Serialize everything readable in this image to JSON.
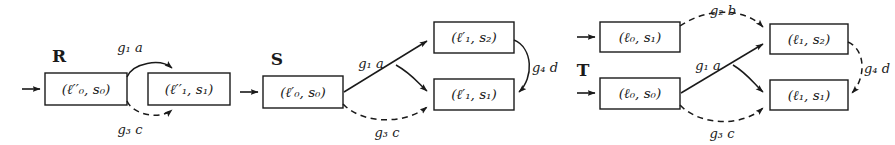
{
  "figure": {
    "width": 895,
    "height": 145,
    "background": "#ffffff",
    "ink_color": "#1a1a1a"
  },
  "automata": [
    {
      "name": "R",
      "name_label": "R",
      "states": [
        {
          "id": "r0",
          "label": "(ℓ′′₀, s₀)",
          "loc": "ℓ′′₀",
          "sig": "s₀",
          "initial": true
        },
        {
          "id": "r1",
          "label": "(ℓ′′₁, s₁)",
          "loc": "ℓ′′₁",
          "sig": "s₁",
          "initial": false
        }
      ],
      "transitions": [
        {
          "from": "r0",
          "to": "r1",
          "label": "g₁ a",
          "guard": "g₁",
          "event": "a",
          "style": "solid",
          "position": "upper-arc"
        },
        {
          "from": "r0",
          "to": "r1",
          "label": "g₃ c",
          "guard": "g₃",
          "event": "c",
          "style": "dashed",
          "position": "lower-arc"
        }
      ]
    },
    {
      "name": "S",
      "name_label": "S",
      "states": [
        {
          "id": "s0",
          "label": "(ℓ′₀, s₀)",
          "loc": "ℓ′₀",
          "sig": "s₀",
          "initial": true
        },
        {
          "id": "s2",
          "label": "(ℓ′₁, s₂)",
          "loc": "ℓ′₁",
          "sig": "s₂",
          "initial": false
        },
        {
          "id": "s1",
          "label": "(ℓ′₁, s₁)",
          "loc": "ℓ′₁",
          "sig": "s₁",
          "initial": false
        }
      ],
      "transitions": [
        {
          "from": "s0",
          "to": "s2",
          "label": "g₁ a",
          "guard": "g₁",
          "event": "a",
          "style": "solid",
          "position": "up-right"
        },
        {
          "from": "s0",
          "to": "s1",
          "label": "",
          "guard": "g₁",
          "event": "a",
          "style": "solid",
          "position": "branch-down"
        },
        {
          "from": "s2",
          "to": "s1",
          "label": "g₄ d",
          "guard": "g₄",
          "event": "d",
          "style": "solid",
          "position": "right-curve"
        },
        {
          "from": "s0",
          "to": "s1",
          "label": "g₃ c",
          "guard": "g₃",
          "event": "c",
          "style": "dashed",
          "position": "lower-arc"
        }
      ]
    },
    {
      "name": "T",
      "name_label": "T",
      "states": [
        {
          "id": "t01",
          "label": "(ℓ₀, s₁)",
          "loc": "ℓ₀",
          "sig": "s₁",
          "initial": true
        },
        {
          "id": "t00",
          "label": "(ℓ₀, s₀)",
          "loc": "ℓ₀",
          "sig": "s₀",
          "initial": true
        },
        {
          "id": "t12",
          "label": "(ℓ₁, s₂)",
          "loc": "ℓ₁",
          "sig": "s₂",
          "initial": false
        },
        {
          "id": "t11",
          "label": "(ℓ₁, s₁)",
          "loc": "ℓ₁",
          "sig": "s₁",
          "initial": false
        }
      ],
      "transitions": [
        {
          "from": "t01",
          "to": "t12",
          "label": "g₂ b",
          "guard": "g₂",
          "event": "b",
          "style": "dashed",
          "position": "upper-arc"
        },
        {
          "from": "t00",
          "to": "t12",
          "label": "g₁ a",
          "guard": "g₁",
          "event": "a",
          "style": "solid",
          "position": "up-right"
        },
        {
          "from": "t00",
          "to": "t11",
          "label": "",
          "guard": "g₁",
          "event": "a",
          "style": "solid",
          "position": "branch-down"
        },
        {
          "from": "t12",
          "to": "t11",
          "label": "g₄ d",
          "guard": "g₄",
          "event": "d",
          "style": "dashed",
          "position": "right-curve"
        },
        {
          "from": "t00",
          "to": "t11",
          "label": "g₃ c",
          "guard": "g₃",
          "event": "c",
          "style": "dashed",
          "position": "lower-arc"
        }
      ]
    }
  ],
  "labels": {
    "r_name": "R",
    "r_state0": "(ℓ′′₀, s₀)",
    "r_state1": "(ℓ′′₁, s₁)",
    "r_edge_top": "g₁ a",
    "r_edge_bottom": "g₃ c",
    "s_name": "S",
    "s_state0": "(ℓ′₀, s₀)",
    "s_state2": "(ℓ′₁, s₂)",
    "s_state1": "(ℓ′₁, s₁)",
    "s_edge_a": "g₁ a",
    "s_edge_d": "g₄ d",
    "s_edge_c": "g₃ c",
    "t_name": "T",
    "t_state01": "(ℓ₀, s₁)",
    "t_state00": "(ℓ₀, s₀)",
    "t_state12": "(ℓ₁, s₂)",
    "t_state11": "(ℓ₁, s₁)",
    "t_edge_b": "g₂ b",
    "t_edge_a": "g₁ a",
    "t_edge_d": "g₄ d",
    "t_edge_c": "g₃ c"
  }
}
